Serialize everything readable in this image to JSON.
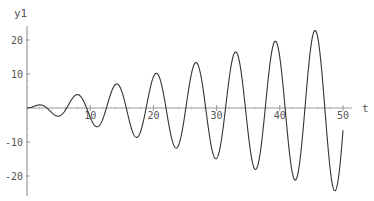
{
  "chart_data": {
    "type": "line",
    "title": "",
    "xlabel": "t",
    "ylabel": "y1",
    "xlim": [
      0,
      50
    ],
    "ylim": [
      -25,
      25
    ],
    "grid": false,
    "legend": null,
    "x_ticks": [
      10,
      20,
      30,
      40,
      50
    ],
    "x_tick_labels": [
      "10",
      "20",
      "30",
      "40",
      "50"
    ],
    "y_ticks": [
      -20,
      -10,
      10,
      20
    ],
    "y_tick_labels": [
      "-20",
      "-10",
      "10",
      "20"
    ],
    "series": [
      {
        "name": "y1",
        "formula_estimate": "y1 = (t/2)·sin(t)",
        "color": "#333333",
        "x": [
          0,
          1.6,
          3.2,
          4.8,
          6.4,
          7.9,
          9.5,
          11.1,
          12.7,
          14.2,
          15.8,
          17.4,
          19.0,
          20.5,
          22.1,
          23.7,
          25.3,
          26.8,
          28.4,
          30.0,
          31.6,
          33.1,
          34.7,
          36.3,
          37.9,
          39.4,
          41.0,
          42.6,
          44.2,
          45.6,
          47.3,
          48.7,
          50.0
        ],
        "y": [
          0,
          0.8,
          -0.1,
          -2.4,
          0.4,
          3.9,
          -0.3,
          -5.5,
          0.6,
          7.0,
          -0.1,
          -8.6,
          1.4,
          10.1,
          -0.1,
          -11.8,
          1.1,
          13.4,
          0.3,
          -14.9,
          1.2,
          16.5,
          -0.6,
          -18.1,
          2.0,
          19.6,
          -1.3,
          -21.3,
          3.0,
          22.7,
          -1.2,
          -24.4,
          -6.6
        ]
      }
    ],
    "extrema": [
      {
        "t": 2.0,
        "y": 0.9
      },
      {
        "t": 4.9,
        "y": -2.4
      },
      {
        "t": 8.0,
        "y": 3.9
      },
      {
        "t": 11.1,
        "y": -5.5
      },
      {
        "t": 14.2,
        "y": 7.0
      },
      {
        "t": 17.3,
        "y": -8.6
      },
      {
        "t": 20.4,
        "y": 10.2
      },
      {
        "t": 23.6,
        "y": -11.8
      },
      {
        "t": 26.7,
        "y": 13.4
      },
      {
        "t": 29.9,
        "y": -14.9
      },
      {
        "t": 33.0,
        "y": 16.5
      },
      {
        "t": 36.1,
        "y": -18.1
      },
      {
        "t": 39.3,
        "y": 19.6
      },
      {
        "t": 42.4,
        "y": -21.2
      },
      {
        "t": 45.6,
        "y": 22.8
      },
      {
        "t": 48.7,
        "y": -24.4
      }
    ]
  }
}
